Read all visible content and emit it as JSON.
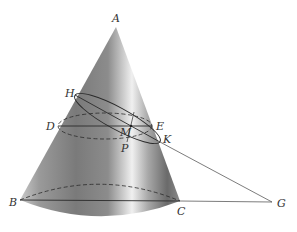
{
  "labels": {
    "A": "A",
    "H": "H",
    "D": "D",
    "E": "E",
    "M": "M",
    "K": "K",
    "P": "P",
    "B": "B",
    "C": "C",
    "G": "G"
  },
  "colors": {
    "line": "#2a2a2a",
    "cone_dark": "#6e6e6e",
    "cone_light": "#e6e6e6",
    "label": "#333333"
  }
}
